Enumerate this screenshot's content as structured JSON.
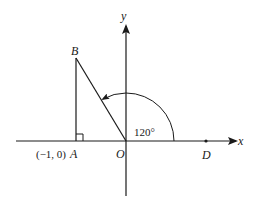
{
  "diagram": {
    "type": "coordinate-geometry",
    "axes": {
      "x_label": "x",
      "y_label": "y"
    },
    "points": {
      "origin": {
        "label": "O"
      },
      "A": {
        "label": "A",
        "coord_label": "(−1, 0)"
      },
      "B": {
        "label": "B"
      },
      "D": {
        "label": "D"
      }
    },
    "angle": {
      "label": "120°",
      "value_deg": 120
    },
    "right_angle_at": "A",
    "segments": [
      "AB",
      "BO"
    ]
  }
}
